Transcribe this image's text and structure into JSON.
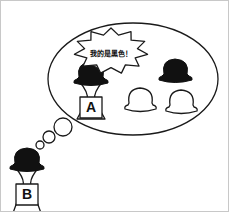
{
  "scene": {
    "title": "Two figures with hats thought bubble illustration",
    "background_color": "#ffffff",
    "ink_color": "#1a1a1a",
    "black_fill": "#111111",
    "width": 229,
    "height": 212
  },
  "thought_bubble": {
    "name": "thought-bubble",
    "shape": "ellipse",
    "center_x": 132,
    "center_y": 78,
    "radius_x": 85,
    "radius_y": 56,
    "connector_bubbles": [
      {
        "cx": 62,
        "cy": 126,
        "r": 9
      },
      {
        "cx": 48,
        "cy": 136,
        "r": 6
      },
      {
        "cx": 39,
        "cy": 144,
        "r": 4
      }
    ]
  },
  "speech_burst": {
    "name": "speech-starburst",
    "text": "我的是黑色！",
    "text_x": 110,
    "text_y": 53,
    "center_x": 110,
    "center_y": 50,
    "outer_radius_x": 37,
    "outer_radius_y": 23,
    "inner_ratio": 0.72,
    "points": 11
  },
  "figures": [
    {
      "name": "figure-a",
      "label": "A",
      "position": "inside-bubble",
      "hat_color": "#111111",
      "hat_color_name": "black",
      "x": 90,
      "y": 72,
      "label_x": 90,
      "label_y": 106
    },
    {
      "name": "figure-b",
      "label": "B",
      "position": "outside-bubble-bottom-left",
      "hat_color": "#111111",
      "hat_color_name": "black",
      "x": 26,
      "y": 158,
      "label_x": 26,
      "label_y": 193
    }
  ],
  "hats": [
    {
      "name": "hat-black-upper-right",
      "color": "#111111",
      "color_name": "black",
      "filled": true,
      "cx": 174,
      "cy": 69,
      "scale": 1.0
    },
    {
      "name": "hat-white-lower-left",
      "color": "#ffffff",
      "color_name": "white",
      "filled": false,
      "cx": 139,
      "cy": 97,
      "scale": 1.0
    },
    {
      "name": "hat-white-lower-right",
      "color": "#ffffff",
      "color_name": "white",
      "filled": false,
      "cx": 180,
      "cy": 99,
      "scale": 1.0
    }
  ]
}
